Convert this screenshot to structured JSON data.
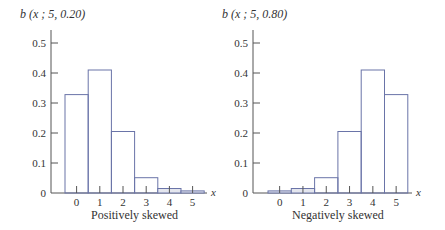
{
  "chart_data": [
    {
      "type": "bar",
      "title": "b (x ; 5, 0.20)",
      "subtitle": "Positively skewed",
      "xlabel": "x",
      "ylabel": "b (x ; 5, 0.20)",
      "categories": [
        "0",
        "1",
        "2",
        "3",
        "4",
        "5"
      ],
      "values": [
        0.328,
        0.41,
        0.205,
        0.051,
        0.015,
        0.007
      ],
      "yticks": [
        "0",
        "0.1",
        "0.2",
        "0.3",
        "0.4",
        "0.5"
      ],
      "ylim": [
        0,
        0.5
      ],
      "grid": false,
      "legend": null
    },
    {
      "type": "bar",
      "title": "b (x ; 5, 0.80)",
      "subtitle": "Negatively skewed",
      "xlabel": "x",
      "ylabel": "b (x ; 5, 0.80)",
      "categories": [
        "0",
        "1",
        "2",
        "3",
        "4",
        "5"
      ],
      "values": [
        0.007,
        0.015,
        0.051,
        0.205,
        0.41,
        0.328
      ],
      "yticks": [
        "0",
        "0.1",
        "0.2",
        "0.3",
        "0.4",
        "0.5"
      ],
      "ylim": [
        0,
        0.5
      ],
      "grid": false,
      "legend": null
    }
  ],
  "colors": {
    "bar_stroke": "#6a74a8",
    "axis": "#555555",
    "small_bar_fill": "#e4e6ee",
    "text": "#333333"
  }
}
